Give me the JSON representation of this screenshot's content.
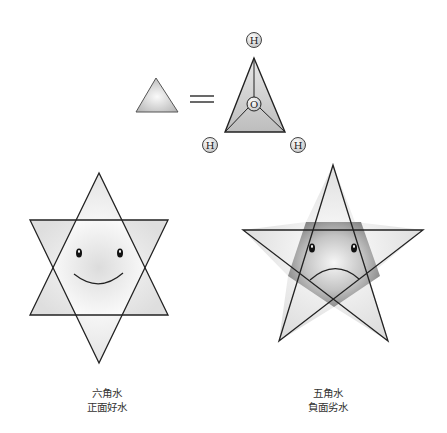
{
  "molecule": {
    "top_atom": "H",
    "center_atom": "O",
    "left_atom": "H",
    "right_atom": "H",
    "equals_symbol": "="
  },
  "hexagram": {
    "title": "六角水",
    "subtitle": "正面好水",
    "face": "smile"
  },
  "pentagram": {
    "title": "五角水",
    "subtitle": "負面劣水",
    "face": "frown"
  },
  "colors": {
    "stroke": "#222222",
    "fill_light": "#f4f4f4",
    "fill_mid": "#cfcfcf",
    "fill_dark": "#8a8a8a"
  }
}
